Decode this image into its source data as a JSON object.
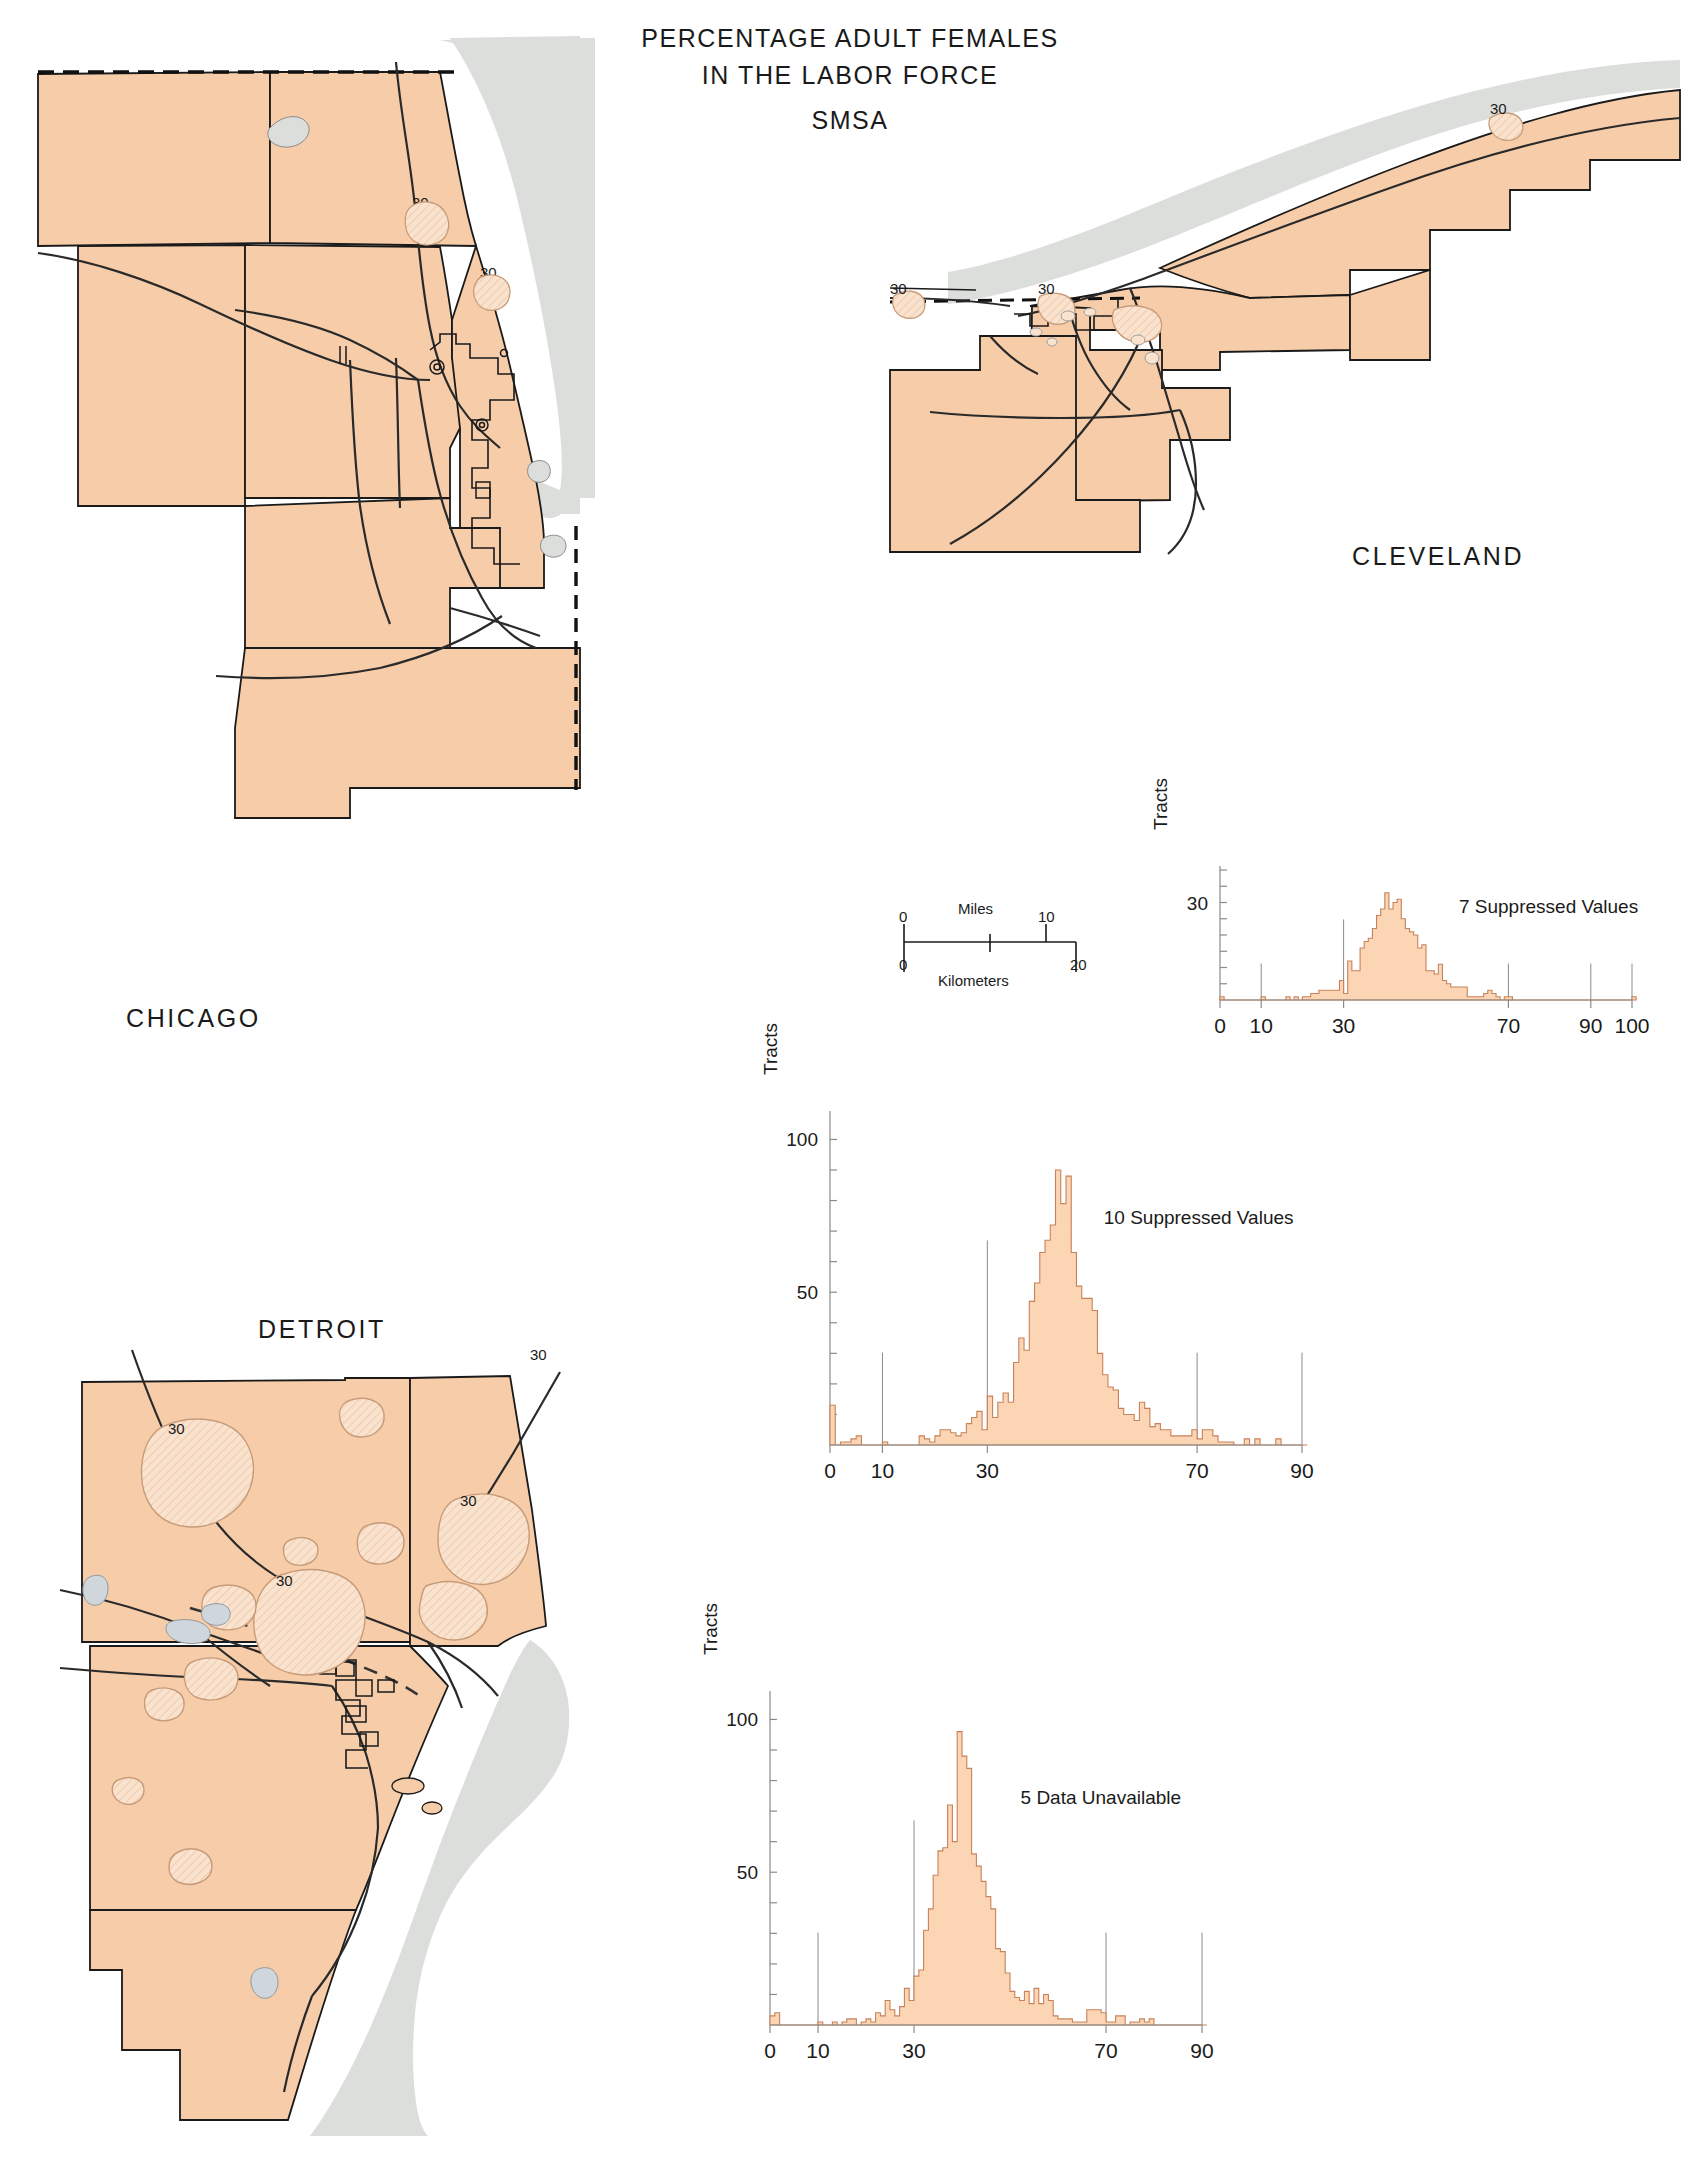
{
  "page": {
    "title_line1": "PERCENTAGE ADULT FEMALES",
    "title_line2": "IN THE LABOR FORCE",
    "title_line3": "SMSA",
    "top_cut_text": "",
    "background": "#ffffff",
    "land_color": "#F7CDA9",
    "land_light_color": "#FAE3CE",
    "water_color": "#DCDEDC",
    "line_color": "#1a1a1a",
    "hist_fill": "#FBD5B4",
    "hist_stroke": "#C8825A"
  },
  "maps": [
    {
      "id": "chicago",
      "label": "CHICAGO",
      "contour_labels": [
        "30",
        "30"
      ]
    },
    {
      "id": "cleveland",
      "label": "CLEVELAND",
      "contour_labels": [
        "30",
        "30",
        "30"
      ]
    },
    {
      "id": "detroit",
      "label": "DETROIT",
      "contour_labels": [
        "30",
        "30",
        "30",
        "30"
      ]
    }
  ],
  "scale_bar": {
    "miles_label": "Miles",
    "kilometers_label": "Kilometers",
    "miles_ticks": [
      "0",
      "10"
    ],
    "km_ticks": [
      "0",
      "20"
    ]
  },
  "chart_data": [
    {
      "id": "cleveland-histogram",
      "type": "bar",
      "title": "",
      "xlabel": "",
      "ylabel": "Tracts",
      "annotation": "7  Suppressed Values",
      "annotation_count": "7",
      "annotation_text": "Suppressed Values",
      "xticks": [
        "0",
        "10",
        "30",
        "70",
        "90",
        "100"
      ],
      "xtick_values": [
        0,
        10,
        30,
        70,
        90,
        100
      ],
      "yticks": [
        "30"
      ],
      "ytick_values": [
        30
      ],
      "xlim": [
        0,
        100
      ],
      "ylim": [
        0,
        40
      ],
      "grid": false,
      "legend": "none",
      "bin_width": 1,
      "x": [
        0,
        1,
        2,
        3,
        4,
        5,
        6,
        7,
        8,
        9,
        10,
        11,
        12,
        13,
        14,
        15,
        16,
        17,
        18,
        19,
        20,
        21,
        22,
        23,
        24,
        25,
        26,
        27,
        28,
        29,
        30,
        31,
        32,
        33,
        34,
        35,
        36,
        37,
        38,
        39,
        40,
        41,
        42,
        43,
        44,
        45,
        46,
        47,
        48,
        49,
        50,
        51,
        52,
        53,
        54,
        55,
        56,
        57,
        58,
        59,
        60,
        61,
        62,
        63,
        64,
        65,
        66,
        67,
        68,
        69,
        70,
        71,
        72,
        73,
        74,
        75,
        76,
        77,
        78,
        79,
        80,
        81,
        82,
        83,
        84,
        85,
        86,
        87,
        88,
        89,
        90,
        91,
        92,
        93,
        94,
        95,
        96,
        97,
        98,
        99,
        100
      ],
      "values": [
        1,
        0,
        0,
        0,
        0,
        0,
        0,
        0,
        0,
        0,
        1,
        0,
        0,
        0,
        0,
        0,
        1,
        0,
        1,
        0,
        1,
        1,
        2,
        2,
        3,
        3,
        3,
        3,
        3,
        6,
        2,
        12,
        9,
        9,
        16,
        18,
        19,
        22,
        26,
        28,
        33,
        28,
        30,
        31,
        25,
        22,
        21,
        20,
        16,
        17,
        9,
        9,
        8,
        11,
        6,
        5,
        4,
        4,
        4,
        4,
        1,
        1,
        1,
        1,
        2,
        3,
        2,
        1,
        0,
        1,
        1,
        0,
        0,
        0,
        0,
        0,
        0,
        0,
        0,
        0,
        0,
        0,
        0,
        0,
        0,
        0,
        0,
        0,
        0,
        0,
        0,
        0,
        0,
        0,
        0,
        0,
        0,
        0,
        0,
        0,
        1
      ],
      "reference_lines": [
        10,
        30,
        70,
        90,
        100
      ]
    },
    {
      "id": "chicago-histogram",
      "type": "bar",
      "title": "",
      "xlabel": "",
      "ylabel": "Tracts",
      "annotation": "10  Suppressed Values",
      "annotation_count": "10",
      "annotation_text": "Suppressed Values",
      "xticks": [
        "0",
        "10",
        "30",
        "70",
        "90"
      ],
      "xtick_values": [
        0,
        10,
        30,
        70,
        90
      ],
      "yticks": [
        "50",
        "100"
      ],
      "ytick_values": [
        50,
        100
      ],
      "xlim": [
        0,
        90
      ],
      "ylim": [
        0,
        108
      ],
      "grid": false,
      "legend": "none",
      "bin_width": 1,
      "x": [
        0,
        1,
        2,
        3,
        4,
        5,
        6,
        7,
        8,
        9,
        10,
        11,
        12,
        13,
        14,
        15,
        16,
        17,
        18,
        19,
        20,
        21,
        22,
        23,
        24,
        25,
        26,
        27,
        28,
        29,
        30,
        31,
        32,
        33,
        34,
        35,
        36,
        37,
        38,
        39,
        40,
        41,
        42,
        43,
        44,
        45,
        46,
        47,
        48,
        49,
        50,
        51,
        52,
        53,
        54,
        55,
        56,
        57,
        58,
        59,
        60,
        61,
        62,
        63,
        64,
        65,
        66,
        67,
        68,
        69,
        70,
        71,
        72,
        73,
        74,
        75,
        76,
        77,
        78,
        79,
        80,
        81,
        82,
        83,
        84,
        85,
        86,
        87,
        88,
        89,
        90
      ],
      "values": [
        13,
        0,
        1,
        1,
        2,
        3,
        0,
        0,
        0,
        0,
        1,
        0,
        0,
        0,
        0,
        0,
        0,
        3,
        2,
        1,
        3,
        5,
        5,
        4,
        3,
        4,
        7,
        9,
        11,
        5,
        16,
        9,
        14,
        17,
        14,
        27,
        35,
        31,
        47,
        53,
        63,
        67,
        72,
        90,
        79,
        88,
        63,
        52,
        48,
        48,
        44,
        30,
        23,
        19,
        18,
        12,
        10,
        10,
        8,
        14,
        12,
        6,
        7,
        5,
        5,
        3,
        3,
        3,
        3,
        5,
        2,
        5,
        5,
        3,
        1,
        1,
        1,
        0,
        0,
        2,
        0,
        2,
        0,
        0,
        0,
        2,
        0,
        0,
        0,
        0,
        0
      ],
      "reference_lines": [
        10,
        30,
        70,
        90
      ]
    },
    {
      "id": "detroit-histogram",
      "type": "bar",
      "title": "",
      "xlabel": "",
      "ylabel": "Tracts",
      "annotation": "5  Data Unavailable",
      "annotation_count": "5",
      "annotation_text": "Data Unavailable",
      "xticks": [
        "0",
        "10",
        "30",
        "70",
        "90"
      ],
      "xtick_values": [
        0,
        10,
        30,
        70,
        90
      ],
      "yticks": [
        "50",
        "100"
      ],
      "ytick_values": [
        50,
        100
      ],
      "xlim": [
        0,
        90
      ],
      "ylim": [
        0,
        108
      ],
      "grid": false,
      "legend": "none",
      "bin_width": 1,
      "x": [
        0,
        1,
        2,
        3,
        4,
        5,
        6,
        7,
        8,
        9,
        10,
        11,
        12,
        13,
        14,
        15,
        16,
        17,
        18,
        19,
        20,
        21,
        22,
        23,
        24,
        25,
        26,
        27,
        28,
        29,
        30,
        31,
        32,
        33,
        34,
        35,
        36,
        37,
        38,
        39,
        40,
        41,
        42,
        43,
        44,
        45,
        46,
        47,
        48,
        49,
        50,
        51,
        52,
        53,
        54,
        55,
        56,
        57,
        58,
        59,
        60,
        61,
        62,
        63,
        64,
        65,
        66,
        67,
        68,
        69,
        70,
        71,
        72,
        73,
        74,
        75,
        76,
        77,
        78,
        79,
        80,
        81,
        82,
        83,
        84,
        85,
        86,
        87,
        88,
        89,
        90
      ],
      "values": [
        3,
        4,
        0,
        0,
        0,
        0,
        0,
        0,
        0,
        0,
        1,
        0,
        0,
        1,
        0,
        1,
        2,
        2,
        0,
        1,
        2,
        1,
        4,
        3,
        8,
        5,
        3,
        6,
        12,
        8,
        16,
        18,
        31,
        38,
        49,
        57,
        58,
        72,
        60,
        96,
        88,
        84,
        56,
        52,
        47,
        42,
        38,
        25,
        24,
        17,
        11,
        9,
        8,
        11,
        7,
        12,
        7,
        10,
        8,
        3,
        2,
        2,
        2,
        1,
        1,
        1,
        5,
        5,
        5,
        4,
        1,
        1,
        3,
        3,
        0,
        1,
        1,
        2,
        1,
        2,
        0,
        0,
        0,
        0,
        0,
        0,
        0,
        0,
        0,
        0,
        0
      ],
      "reference_lines": [
        10,
        30,
        70,
        90
      ]
    }
  ]
}
